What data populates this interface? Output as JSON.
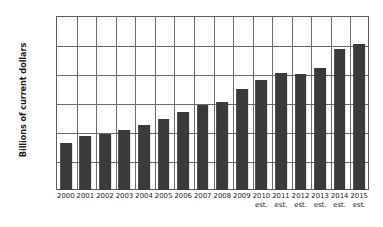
{
  "chart_data": {
    "type": "bar",
    "title": "",
    "xlabel": "",
    "ylabel": "Billions of current dollars",
    "ylim": [
      0,
      1200
    ],
    "ytick_labels": [
      "1,200",
      "1,000",
      "800",
      "600",
      "400",
      "200",
      "0"
    ],
    "ytick_values": [
      1200,
      1000,
      800,
      600,
      400,
      200,
      0
    ],
    "grid": "horizontal-and-vertical",
    "legend": "none",
    "bar_color": "#3a3a3a",
    "categories": [
      "2000",
      "2001",
      "2002",
      "2003",
      "2004",
      "2005",
      "2006",
      "2007",
      "2008",
      "2009",
      "2010",
      "2011",
      "2012",
      "2013",
      "2014",
      "2015"
    ],
    "category_notes": [
      "",
      "",
      "",
      "",
      "",
      "",
      "",
      "",
      "",
      "",
      "est.",
      "est.",
      "est.",
      "est.",
      "est.",
      "est."
    ],
    "values": [
      325,
      370,
      388,
      412,
      445,
      492,
      535,
      587,
      605,
      695,
      757,
      805,
      797,
      840,
      975,
      1010
    ]
  }
}
